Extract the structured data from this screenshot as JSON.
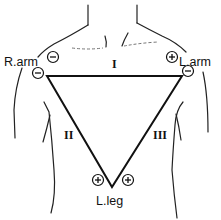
{
  "diagram": {
    "labels": {
      "right_arm": "R.arm",
      "left_arm": "L.arm",
      "left_leg": "L.leg"
    },
    "leads": {
      "lead_1": "I",
      "lead_2": "II",
      "lead_3": "III"
    },
    "polarity": {
      "r_arm_lead1": "−",
      "r_arm_lead2": "−",
      "l_arm_lead1": "+",
      "l_arm_lead3": "−",
      "l_leg_lead2": "+",
      "l_leg_lead3": "+"
    },
    "colors": {
      "line": "#111111",
      "background": "#ffffff"
    }
  }
}
